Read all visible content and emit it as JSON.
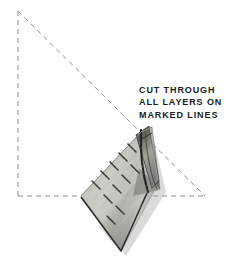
{
  "figure": {
    "name": "fabric-cutting-diagram",
    "background_color": "#ffffff",
    "width": 226,
    "height": 276
  },
  "caption": {
    "lines": [
      "CUT THROUGH",
      "ALL LAYERS ON",
      "MARKED LINES"
    ],
    "color": "#1b1b1b"
  },
  "guide_triangle": {
    "name": "dashed-right-triangle",
    "style": "dashed",
    "color": "#8c8c8c",
    "dash_pattern": "5,4",
    "stroke_width": 1,
    "apex": {
      "x": 18,
      "y": 11
    },
    "bottom_left": {
      "x": 18,
      "y": 196
    },
    "bottom_right": {
      "x": 205,
      "y": 196
    }
  },
  "fabric": {
    "name": "folded-fabric-strip",
    "description": "folded fabric bundle laid diagonally across the triangle",
    "base_color": "#b9b7b2",
    "highlight_color": "#d8d6d1",
    "shadow_color": "#6e6c68",
    "edge_color": "#2b2a28",
    "corner_top": {
      "x": 148,
      "y": 128
    },
    "corner_right": {
      "x": 160,
      "y": 190
    },
    "corner_bottom": {
      "x": 122,
      "y": 252
    },
    "corner_left": {
      "x": 82,
      "y": 196
    },
    "marked_lines_count": 11,
    "marked_line_color": "#3a3836",
    "fold_line_color": "#232220"
  }
}
